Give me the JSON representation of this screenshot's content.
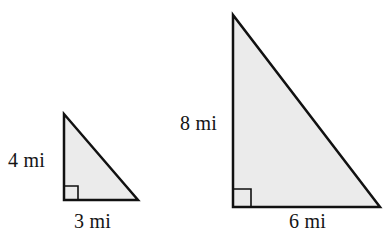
{
  "figure": {
    "kind": "geometry-diagram",
    "background_color": "#ffffff",
    "fill_color": "#ebebeb",
    "stroke_color": "#111111",
    "stroke_width": 2.5,
    "unit": "mi"
  },
  "shapes": [
    {
      "id": "small-triangle",
      "name": "small-right-triangle",
      "type": "right-triangle",
      "points": "64,114 64,200 138,200",
      "right_angle_vertex": "64,200",
      "right_angle_marker": "64,186 78,186 78,200",
      "vertical_leg": "4",
      "horizontal_leg": "3",
      "labels": {
        "vertical": "4 mi",
        "horizontal": "3 mi"
      }
    },
    {
      "id": "large-triangle",
      "name": "large-right-triangle",
      "type": "right-triangle",
      "points": "233,15 233,207 380,207",
      "right_angle_vertex": "233,207",
      "right_angle_marker": "233,189 251,189 251,207",
      "vertical_leg": "8",
      "horizontal_leg": "6",
      "labels": {
        "vertical": "8 mi",
        "horizontal": "6 mi"
      }
    }
  ],
  "labels": {
    "small_vertical": "4 mi",
    "small_horizontal": "3 mi",
    "large_vertical": "8 mi",
    "large_horizontal": "6 mi"
  },
  "chart_data": {
    "type": "table",
    "title": "",
    "categories": [
      "Small triangle",
      "Large triangle"
    ],
    "series": [
      {
        "name": "Vertical leg (mi)",
        "values": [
          4,
          8
        ]
      },
      {
        "name": "Horizontal leg (mi)",
        "values": [
          3,
          6
        ]
      }
    ],
    "annotations": [
      "4 mi",
      "3 mi",
      "8 mi",
      "6 mi"
    ],
    "xlabel": "",
    "ylabel": ""
  }
}
